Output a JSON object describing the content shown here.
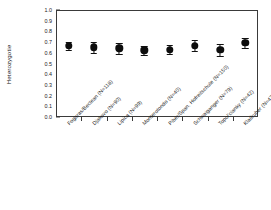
{
  "chart_data": {
    "type": "scatter",
    "title": "",
    "xlabel": "",
    "ylabel": "Heterozygotie",
    "ylim": [
      0.0,
      1.0
    ],
    "ytick_labels": [
      "1.0",
      "0.9",
      "0.8",
      "0.7",
      "0.6",
      "0.5",
      "0.4",
      "0.3",
      "0.2",
      "0.1",
      "0.0"
    ],
    "ytick_values": [
      1.0,
      0.9,
      0.8,
      0.7,
      0.6,
      0.5,
      0.4,
      0.3,
      0.2,
      0.1,
      0.0
    ],
    "grid": false,
    "legend": "none",
    "error_type": "error-bars",
    "categories": [
      "Fogaras/Beclean (N=118)",
      "Djakovo (N=90)",
      "Lipica (N=99)",
      "Monterotondo (N=40)",
      "Piber/Span. Hofreitschule (N=150)",
      "Schwaiganger (N=79)",
      "Topol'cianky (N=42)",
      "Kladruber (N=47)"
    ],
    "values": [
      0.665,
      0.652,
      0.642,
      0.622,
      0.63,
      0.668,
      0.627,
      0.693
    ],
    "errors": [
      0.04,
      0.05,
      0.053,
      0.042,
      0.043,
      0.05,
      0.057,
      0.048
    ]
  },
  "axis": {
    "y_title": "Heterozygotie"
  }
}
